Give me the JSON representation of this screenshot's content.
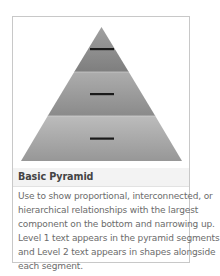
{
  "layout_card": {
    "title": "Basic Pyramid",
    "description_lines": [
      "Use to show proportional, interconnected, or",
      "hierarchical relationships with the largest",
      "component on the bottom and narrowing up.",
      "Level 1 text appears in the pyramid segments",
      "and Level 2 text appears in shapes alongside",
      "each segment."
    ],
    "description": "Use to show proportional, interconnected, or hierarchical relationships with the largest component on the bottom and narrowing up. Level 1 text appears in the pyramid segments and Level 2 text appears in shapes alongside each segment.",
    "preview": {
      "icon": "basic-pyramid-icon",
      "segments": [
        {
          "level": 1,
          "color_top": "#9a9a9a",
          "color_bottom": "#7f7f7f",
          "placeholder": "text-placeholder-dash"
        },
        {
          "level": 2,
          "color_top": "#a6a6a6",
          "color_bottom": "#8e8e8e",
          "placeholder": "text-placeholder-dash"
        },
        {
          "level": 3,
          "color_top": "#b4b4b4",
          "color_bottom": "#9c9c9c",
          "placeholder": "text-placeholder-dash"
        }
      ]
    }
  },
  "colors": {
    "card_border": "#c8c8c8",
    "title_bg": "#f3f3f3",
    "title_text": "#444444",
    "description_text": "#6b6b6b",
    "dash": "#1a1a1a"
  }
}
